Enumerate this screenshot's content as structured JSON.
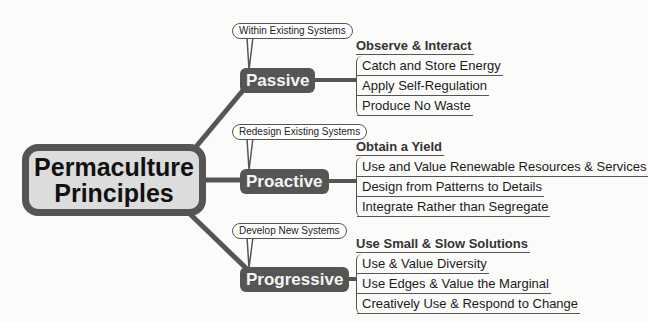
{
  "root": {
    "line1": "Permaculture",
    "line2": "Principles"
  },
  "branches": [
    {
      "label": "Passive",
      "callout": "Within Existing Systems",
      "group_title": "Observe & Interact",
      "items": [
        "Catch and Store Energy",
        "Apply Self-Regulation",
        "Produce No Waste"
      ]
    },
    {
      "label": "Proactive",
      "callout": "Redesign Existing Systems",
      "group_title": "Obtain a Yield",
      "items": [
        "Use and Value Renewable Resources & Services",
        "Design from Patterns to Details",
        "Integrate Rather than Segregate"
      ]
    },
    {
      "label": "Progressive",
      "callout": "Develop New Systems",
      "group_title": "Use Small & Slow Solutions",
      "items": [
        "Use & Value Diversity",
        "Use Edges & Value the Marginal",
        "Creatively Use & Respond to Change"
      ]
    }
  ],
  "colors": {
    "node_fill": "#555555",
    "root_fill": "#dcdcdc",
    "line": "#555555",
    "background": "#fbfbfa"
  }
}
